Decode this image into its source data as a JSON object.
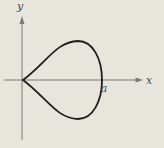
{
  "labels": {
    "y_axis": "y",
    "x_axis": "x",
    "x_intercept": "a"
  },
  "colors": {
    "background": "#e8e5dd",
    "axis": "#7b7b78",
    "curve": "#1e1e1e",
    "label": "#4a4a46"
  }
}
